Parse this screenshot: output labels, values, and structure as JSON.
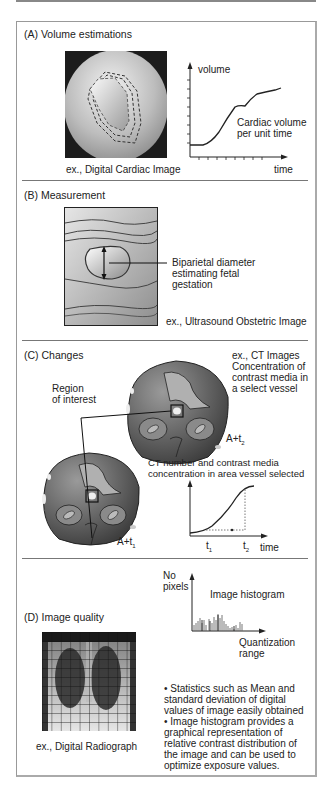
{
  "sections": {
    "a": {
      "title": "(A)  Volume estimations",
      "image_caption": "ex., Digital Cardiac Image",
      "y_axis_label": "volume",
      "x_axis_label": "time",
      "curve_label_line1": "Cardiac volume",
      "curve_label_line2": "per unit time"
    },
    "b": {
      "title": "(B)  Measurement",
      "annotation_line1": "Biparietal diameter",
      "annotation_line2": "estimating fetal",
      "annotation_line3": "gestation",
      "image_caption": "ex., Ultrasound Obstetric Image"
    },
    "c": {
      "title": "(C)  Changes",
      "caption_line1": "ex., CT Images",
      "caption_line2": "Concentration of",
      "caption_line3": "contrast media in",
      "caption_line4": "a select vessel",
      "roi_line1": "Region",
      "roi_line2": "of interest",
      "label_t2": "A+t",
      "label_t2_sub": "2",
      "label_t1": "A+t",
      "label_t1_sub": "1",
      "graph_title_line1": "CT number and contrast media",
      "graph_title_line2": "concentration in area vessel selected",
      "tick_t1": "t",
      "tick_t1_sub": "1",
      "tick_t2": "t",
      "tick_t2_sub": "2",
      "x_axis_label": "time"
    },
    "d": {
      "title": "(D)  Image quality",
      "y_axis_line1": "No",
      "y_axis_line2": "pixels",
      "histogram_label": "Image histogram",
      "x_axis_line1": "Quantization",
      "x_axis_line2": "range",
      "image_caption": "ex., Digital Radiograph",
      "notes": [
        "• Statistics such as Mean and",
        "standard deviation of digital",
        "values of image easily obtained",
        "• Image histogram provides a",
        "graphical representation of",
        "relative contrast distribution of",
        "the image and can be used to",
        "optimize exposure values."
      ]
    }
  }
}
